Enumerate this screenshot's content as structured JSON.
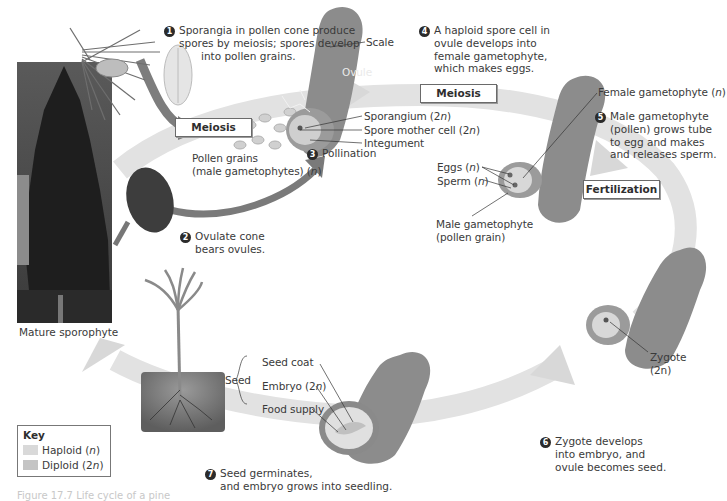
{
  "figure": {
    "caption": "Figure 17.7 Life cycle of a pine",
    "colors": {
      "haploid": "#d9d9d9",
      "diploid": "#c4c4c4",
      "cycle_arrow": "#e3e3e3",
      "scale_shape": "#8a8a8a",
      "step_badge": "#2b2b2b",
      "background": "#ffffff"
    }
  },
  "photo": {
    "label": "Mature sporophyte"
  },
  "processes": {
    "meiosis_left": "Meiosis",
    "meiosis_right": "Meiosis",
    "fertilization": "Fertilization"
  },
  "steps": [
    {
      "num": "1",
      "lines": [
        "Sporangia in pollen cone produce",
        "spores by meiosis; spores develop",
        "into pollen grains."
      ]
    },
    {
      "num": "2",
      "lines": [
        "Ovulate cone",
        "bears ovules."
      ]
    },
    {
      "num": "3",
      "lines": [
        "Pollination"
      ]
    },
    {
      "num": "4",
      "lines": [
        "A haploid spore cell in",
        "ovule develops into",
        "female gametophyte,",
        "which makes eggs."
      ]
    },
    {
      "num": "5",
      "lines": [
        "Male gametophyte",
        "(pollen) grows tube",
        "to egg and makes",
        "and releases sperm."
      ]
    },
    {
      "num": "6",
      "lines": [
        "Zygote develops",
        "into embryo, and",
        "ovule becomes seed."
      ]
    },
    {
      "num": "7",
      "lines": [
        "Seed germinates,",
        "and embryo grows into seedling."
      ]
    }
  ],
  "labels": {
    "pollen_grains_1": "Pollen grains",
    "pollen_grains_2": "(male gametophytes) (",
    "pollen_grains_n": "n",
    "scale": "Scale",
    "ovule": "Ovule",
    "sporangium": "Sporangium (2",
    "sporangium_n": "n",
    "spore_mother_cell": "Spore mother cell (2",
    "spore_mother_cell_n": "n",
    "integument": "Integument",
    "female_gametophyte": "Female gametophyte (",
    "female_gametophyte_n": "n",
    "eggs": "Eggs (",
    "eggs_n": "n",
    "sperm": "Sperm (",
    "sperm_n": "n",
    "male_gametophyte_1": "Male gametophyte",
    "male_gametophyte_2": "(pollen grain)",
    "zygote_1": "Zygote",
    "zygote_2": "(2n)",
    "seed": "Seed",
    "seed_coat": "Seed coat",
    "embryo": "Embryo (2",
    "embryo_n": "n",
    "food_supply": "Food  supply",
    "close_paren": ")"
  },
  "key": {
    "title": "Key",
    "items": [
      {
        "label": "Haploid (",
        "n": "n",
        "close": ")",
        "color": "#d9d9d9"
      },
      {
        "label": "Diploid (2",
        "n": "n",
        "close": ")",
        "color": "#c4c4c4"
      }
    ]
  }
}
